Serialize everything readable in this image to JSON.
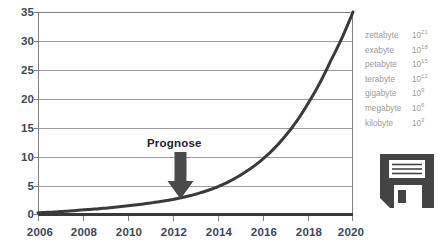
{
  "chart_data": {
    "type": "line",
    "title": "",
    "subtitle": "",
    "xlabel": "",
    "ylabel": "",
    "xlim": [
      2006,
      2020
    ],
    "ylim": [
      0,
      35
    ],
    "grid": true,
    "legend_position": "right",
    "x_ticks": [
      "2006",
      "2008",
      "2010",
      "2012",
      "2014",
      "2016",
      "2018",
      "2020"
    ],
    "x_tick_values": [
      2006,
      2008,
      2010,
      2012,
      2014,
      2016,
      2018,
      2020
    ],
    "y_ticks": [
      "0",
      "5",
      "10",
      "15",
      "20",
      "25",
      "30",
      "35"
    ],
    "y_tick_values": [
      0,
      5,
      10,
      15,
      20,
      25,
      30,
      35
    ],
    "series": [
      {
        "name": "Datenvolumen",
        "color": "#3a3a3a",
        "x": [
          2006,
          2007,
          2008,
          2009,
          2010,
          2011,
          2012,
          2013,
          2014,
          2015,
          2016,
          2017,
          2018,
          2019,
          2020
        ],
        "values": [
          0.3,
          0.5,
          0.8,
          1.1,
          1.5,
          2.0,
          2.6,
          3.5,
          4.8,
          6.8,
          9.6,
          13.6,
          19.2,
          26.5,
          35.0
        ]
      }
    ],
    "annotations": [
      {
        "name": "prognose-annotation",
        "label": "Prognose",
        "x": 2012,
        "marker": "down-arrow",
        "arrow_top_value": 10.5,
        "arrow_tip_value": 2.6
      }
    ]
  },
  "legend": {
    "title": "",
    "rows": [
      {
        "unit": "zettabyte",
        "base": "10",
        "exponent": "21"
      },
      {
        "unit": "exabyte",
        "base": "10",
        "exponent": "18"
      },
      {
        "unit": "petabyte",
        "base": "10",
        "exponent": "15"
      },
      {
        "unit": "terabyte",
        "base": "10",
        "exponent": "12"
      },
      {
        "unit": "gigabyte",
        "base": "10",
        "exponent": "9"
      },
      {
        "unit": "megabyte",
        "base": "10",
        "exponent": "6"
      },
      {
        "unit": "kilobyte",
        "base": "10",
        "exponent": "3"
      }
    ]
  },
  "icons": {
    "storage": "floppy-disk-icon"
  },
  "colors": {
    "curve": "#3a3a3a",
    "axis": "#808080",
    "gridline": "#9a9aa2",
    "tick_text": "#3d4758",
    "legend_text": "#9a9a9a",
    "annotation_text": "#1d2430",
    "arrow": "#4a4a4a",
    "icon": "#444444",
    "plot_background": "#ffffff"
  }
}
